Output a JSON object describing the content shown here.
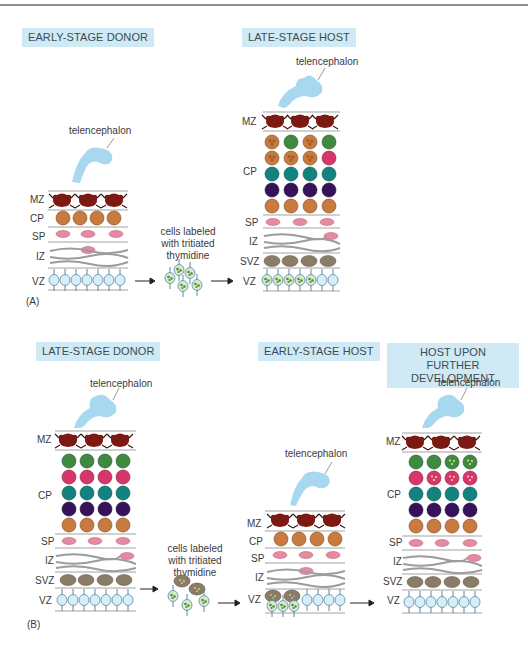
{
  "panels": {
    "A": {
      "letter": "(A)",
      "donor_title": "EARLY-STAGE DONOR",
      "host_title": "LATE-STAGE HOST",
      "donor_telencephalon": "telencephalon",
      "host_telencephalon": "telencephalon",
      "caption_line1": "cells labeled",
      "caption_line2": "with tritiated",
      "caption_line3": "thymidine",
      "donor_layers": [
        "MZ",
        "CP",
        "SP",
        "IZ",
        "VZ"
      ],
      "host_layers": [
        "MZ",
        "CP",
        "SP",
        "IZ",
        "SVZ",
        "VZ"
      ]
    },
    "B": {
      "letter": "(B)",
      "donor_title": "LATE-STAGE DONOR",
      "host_title": "EARLY-STAGE HOST",
      "further_title_line1": "HOST UPON FURTHER",
      "further_title_line2": "DEVELOPMENT",
      "donor_telencephalon": "telencephalon",
      "host_telencephalon": "telencephalon",
      "further_telencephalon": "telencephalon",
      "caption_line1": "cells labeled",
      "caption_line2": "with tritiated",
      "caption_line3": "thymidine",
      "donor_layers": [
        "MZ",
        "CP",
        "SP",
        "IZ",
        "SVZ",
        "VZ"
      ],
      "host_layers": [
        "MZ",
        "CP",
        "SP",
        "IZ",
        "VZ"
      ],
      "further_layers": [
        "MZ",
        "CP",
        "SP",
        "IZ",
        "SVZ",
        "VZ"
      ]
    }
  },
  "colors": {
    "title_bg": "#cfeaf4",
    "telencephalon": "#a8d8f0",
    "mz_cell": "#7a1a12",
    "cp_orange": "#c97a3f",
    "cp_green": "#3f8a3e",
    "cp_pink": "#d8366b",
    "cp_teal": "#13837f",
    "cp_purple": "#35125a",
    "sp_cell": "#e68aa3",
    "svz_cell": "#8a7d68",
    "vz_cell": "#d6eef8",
    "layer_line": "#a3a3a3",
    "label_tan": "#c29a6a"
  }
}
